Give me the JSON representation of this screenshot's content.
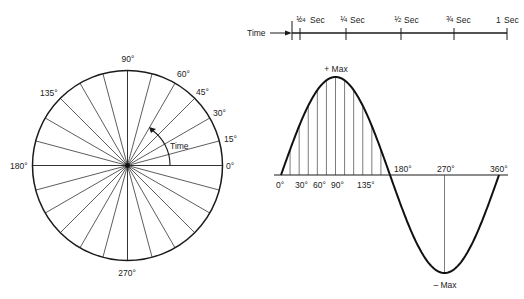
{
  "figure": {
    "background": "#ffffff",
    "ink_color": "#1a1a1a"
  },
  "circle": {
    "spoke_interval_deg": 15,
    "spoke_count": 24,
    "angle_labels": [
      {
        "key": "deg0",
        "text": "0°"
      },
      {
        "key": "deg15",
        "text": "15°"
      },
      {
        "key": "deg30",
        "text": "30°"
      },
      {
        "key": "deg45",
        "text": "45°"
      },
      {
        "key": "deg60",
        "text": "60°"
      },
      {
        "key": "deg90",
        "text": "90°"
      },
      {
        "key": "deg135",
        "text": "135°"
      },
      {
        "key": "deg180",
        "text": "180°"
      },
      {
        "key": "deg270",
        "text": "270°"
      }
    ],
    "rotation_label": "Time"
  },
  "time_axis": {
    "label": "Time",
    "ticks": [
      {
        "num": "1",
        "den": "24",
        "unit": "Sec"
      },
      {
        "num": "1",
        "den": "4",
        "unit": "Sec"
      },
      {
        "num": "1",
        "den": "2",
        "unit": "Sec"
      },
      {
        "num": "3",
        "den": "4",
        "unit": "Sec"
      },
      {
        "whole": "1",
        "unit": "Sec"
      }
    ]
  },
  "sine_wave": {
    "pos_peak_label": "+ Max",
    "neg_peak_label": "– Max",
    "axis_labels": [
      {
        "key": "s0",
        "text": "0°"
      },
      {
        "key": "s30",
        "text": "30°"
      },
      {
        "key": "s60",
        "text": "60°"
      },
      {
        "key": "s90",
        "text": "90°"
      },
      {
        "key": "s135",
        "text": "135°"
      },
      {
        "key": "s180",
        "text": "180°"
      },
      {
        "key": "s270",
        "text": "270°"
      },
      {
        "key": "s360",
        "text": "360°"
      }
    ],
    "hatch_interval_deg": 15
  }
}
